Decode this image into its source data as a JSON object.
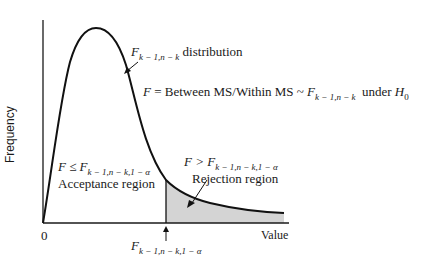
{
  "figure": {
    "y_axis_label": "Frequency",
    "x_axis_label": "Value",
    "origin_label": "0",
    "curve_label": {
      "symbol": "F",
      "subscript": "k − 1,n − k",
      "text": "distribution"
    },
    "statistic_label": {
      "lhs": "F",
      "equals": "=",
      "ratio": "Between MS/Within MS",
      "tilde": "~",
      "dist_symbol": "F",
      "dist_subscript": "k − 1,n − k",
      "under": "under",
      "hypothesis": "H",
      "hypothesis_subscript": "0"
    },
    "acceptance": {
      "condition_lhs": "F ≤ ",
      "condition_symbol": "F",
      "condition_subscript": "k − 1,n − k,1 − α",
      "label": "Acceptance region"
    },
    "rejection": {
      "condition_lhs": "F > ",
      "condition_symbol": "F",
      "condition_subscript": "k − 1,n − k,1 − α",
      "label": "Rejection region"
    },
    "critical_value": {
      "symbol": "F",
      "subscript": "k − 1,n − k,1 − α"
    },
    "colors": {
      "curve": "#111111",
      "axes": "#1a1a1a",
      "rejection_fill": "#d4d4d4"
    }
  }
}
